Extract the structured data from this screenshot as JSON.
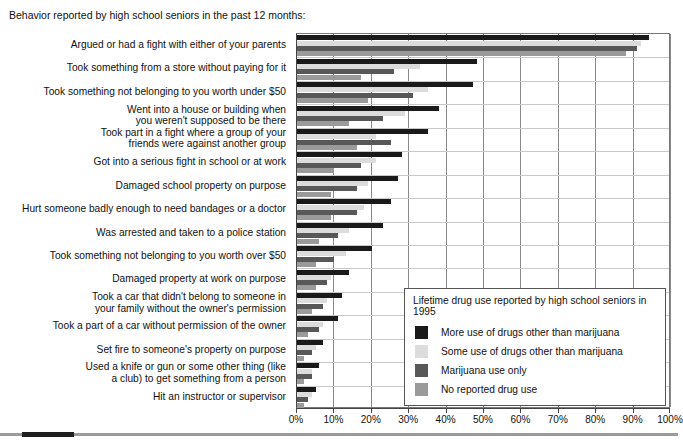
{
  "caption": "Behavior reported by high school seniors in the past 12 months:",
  "legend": {
    "title": "Lifetime drug use reported by high school seniors in 1995",
    "items": [
      {
        "label": "More use of drugs other than marijuana",
        "color": "#1a1a1a"
      },
      {
        "label": "Some use of drugs other than marijuana",
        "color": "#dcdcdc"
      },
      {
        "label": "Marijuana use only",
        "color": "#585858"
      },
      {
        "label": "No reported drug use",
        "color": "#9a9a9a"
      }
    ]
  },
  "axis": {
    "ticks": [
      "0%",
      "10%",
      "20%",
      "30%",
      "40%",
      "50%",
      "60%",
      "70%",
      "80%",
      "90%",
      "100%"
    ]
  },
  "chart_data": {
    "type": "bar",
    "orientation": "horizontal",
    "title": "Behavior reported by high school seniors in the past 12 months:",
    "xlabel": "",
    "ylabel": "",
    "xlim": [
      0,
      100
    ],
    "grid": true,
    "legend_position": "inside-lower-right",
    "legend_title": "Lifetime drug use reported by high school seniors in 1995",
    "categories": [
      "Argued or had a fight with either of your parents",
      "Took something from a store without paying for it",
      "Took something not belonging to you worth under $50",
      "Went into a house or building when\nyou weren't supposed to be there",
      "Took part in a fight where a group of your\nfriends were against another group",
      "Got into a serious fight in school or at work",
      "Damaged school property on purpose",
      "Hurt someone badly enough to need bandages or a doctor",
      "Was arrested and taken to a police station",
      "Took something not belonging to you worth over $50",
      "Damaged property at work on purpose",
      "Took a car that didn't belong to someone in\nyour family without the owner's permission",
      "Took a part of a car without permission of the owner",
      "Set fire to someone's property on purpose",
      "Used a knife or gun or some other thing (like\na club) to get something from a person",
      "Hit an instructor or supervisor"
    ],
    "series": [
      {
        "name": "More use of drugs other than marijuana",
        "color": "#1a1a1a",
        "values": [
          94,
          48,
          47,
          38,
          35,
          28,
          27,
          25,
          23,
          20,
          14,
          12,
          11,
          7,
          6,
          5
        ]
      },
      {
        "name": "Some use of drugs other than marijuana",
        "color": "#dcdcdc",
        "values": [
          92,
          33,
          35,
          29,
          21,
          21,
          19,
          18,
          14,
          13,
          9,
          8,
          7,
          5,
          4,
          4
        ]
      },
      {
        "name": "Marijuana use only",
        "color": "#585858",
        "values": [
          91,
          26,
          31,
          23,
          25,
          17,
          16,
          16,
          11,
          10,
          8,
          7,
          6,
          4,
          4,
          3
        ]
      },
      {
        "name": "No reported drug use",
        "color": "#9a9a9a",
        "values": [
          88,
          17,
          19,
          14,
          16,
          10,
          9,
          9,
          6,
          5,
          5,
          4,
          3,
          2,
          2,
          2
        ]
      }
    ]
  }
}
